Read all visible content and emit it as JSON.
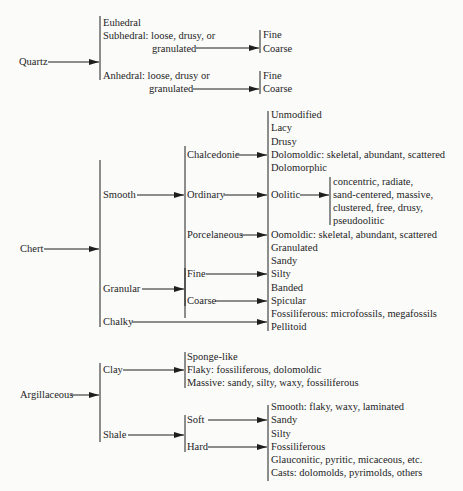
{
  "quartz": {
    "label": "Quartz",
    "types": [
      "Euhedral",
      "Subhedral:  loose, drusy, or",
      "granulated",
      "Anhedral:  loose, drusy or",
      "granulated"
    ],
    "sizes": [
      "Fine",
      "Coarse"
    ]
  },
  "chert": {
    "label": "Chert",
    "level1": [
      "Smooth",
      "Granular",
      "Chalky"
    ],
    "smooth_types": [
      "Chalcedonic",
      "Ordinary",
      "Porcelaneous"
    ],
    "granular_types": [
      "Fine",
      "Coarse"
    ],
    "textures": [
      "Unmodified",
      "Lacy",
      "Drusy",
      "Dolomoldic:  skeletal, abundant, scattered",
      "Dolomorphic",
      "Oolitic",
      "Oomoldic:  skeletal, abundant, scattered",
      "Granulated",
      "Sandy",
      "Silty",
      "Banded",
      "Spicular",
      "Fossiliferous:  microfossils, megafossils",
      "Pellitoid"
    ],
    "oolitic_types": [
      "concentric, radiate,",
      "sand-centered, massive,",
      "clustered, free, drusy,",
      "pseudoolitic"
    ]
  },
  "argillaceous": {
    "label": "Argillaceous",
    "level1": [
      "Clay",
      "Shale"
    ],
    "clay_types": [
      "Sponge-like",
      "Flaky:  fossiliferous, dolomoldic",
      "Massive:  sandy, silty, waxy, fossiliferous"
    ],
    "shale_types": [
      "Soft",
      "Hard"
    ],
    "shale_textures": [
      "Smooth:  flaky, waxy, laminated",
      "Sandy",
      "Silty",
      "Fossiliferous",
      "Glauconitic, pyritic, micaceous, etc.",
      "Casts:  dolomolds, pyrimolds, others"
    ]
  },
  "colors": {
    "ink": "#1e1e1e",
    "paper": "#fbfbfa"
  }
}
